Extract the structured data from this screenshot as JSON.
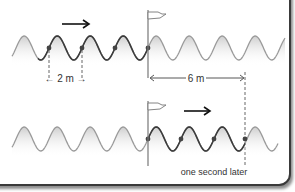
{
  "diagram": {
    "top_panel": {
      "direction_arrow": "right",
      "wavelength_label": "← 2 m →",
      "distance_label": "6 m",
      "flag": "flag-marker"
    },
    "bottom_panel": {
      "direction_arrow": "right",
      "caption": "one second later",
      "flag": "flag-marker"
    },
    "colors": {
      "wave_light": "#9a9a9a",
      "wave_dark": "#3c3c3c",
      "dot": "#444444",
      "fill": "#d8d8d8"
    }
  }
}
